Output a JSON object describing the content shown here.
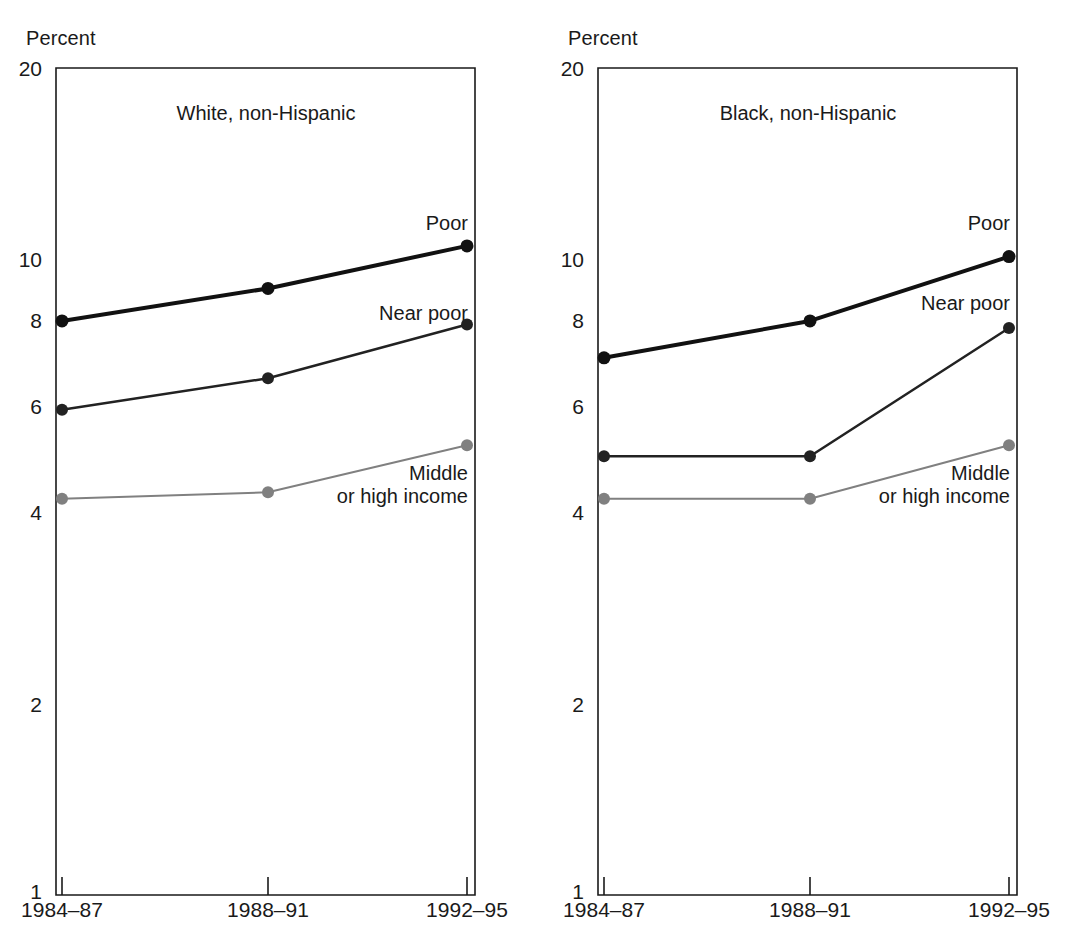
{
  "figure": {
    "axis_unit_label": "Percent",
    "background_color": "#ffffff",
    "ink_color": "#1a1a1a"
  },
  "panels": [
    {
      "id": "white-non-hispanic",
      "title": "White, non-Hispanic",
      "axis_unit_label": "Percent",
      "series_labels": {
        "poor": "Poor",
        "near_poor": "Near poor",
        "middle_line1": "Middle",
        "middle_line2": "or high income"
      }
    },
    {
      "id": "black-non-hispanic",
      "title": "Black, non-Hispanic",
      "axis_unit_label": "Percent",
      "series_labels": {
        "poor": "Poor",
        "near_poor": "Near poor",
        "middle_line1": "Middle",
        "middle_line2": "or high income"
      }
    }
  ],
  "chart_data": [
    {
      "type": "line",
      "title": "White, non-Hispanic",
      "xlabel": "",
      "ylabel": "Percent",
      "yscale": "log",
      "ylim": [
        1,
        20
      ],
      "yticks": [
        1,
        2,
        4,
        6,
        8,
        10,
        20
      ],
      "ytick_labels": [
        "1",
        "2",
        "4",
        "6",
        "8",
        "10",
        "20"
      ],
      "grid": false,
      "legend_position": "inline-right-of-series",
      "categories": [
        "1984–87",
        "1988–91",
        "1992–95"
      ],
      "series": [
        {
          "name": "Poor",
          "values": [
            8.0,
            9.0,
            10.5
          ],
          "color": "#111111",
          "marker_size": 13,
          "line_width": 4
        },
        {
          "name": "Near poor",
          "values": [
            5.8,
            6.5,
            7.9
          ],
          "color": "#222222",
          "marker_size": 12,
          "line_width": 2.5
        },
        {
          "name": "Middle or high income",
          "values": [
            4.2,
            4.3,
            5.1
          ],
          "color": "#808080",
          "marker_size": 12,
          "line_width": 2
        }
      ]
    },
    {
      "type": "line",
      "title": "Black, non-Hispanic",
      "xlabel": "",
      "ylabel": "Percent",
      "yscale": "log",
      "ylim": [
        1,
        20
      ],
      "yticks": [
        1,
        2,
        4,
        6,
        8,
        10,
        20
      ],
      "ytick_labels": [
        "1",
        "2",
        "4",
        "6",
        "8",
        "10",
        "20"
      ],
      "grid": false,
      "legend_position": "inline-right-of-series",
      "categories": [
        "1984–87",
        "1988–91",
        "1992–95"
      ],
      "series": [
        {
          "name": "Poor",
          "values": [
            7.0,
            8.0,
            10.1
          ],
          "color": "#111111",
          "marker_size": 13,
          "line_width": 4
        },
        {
          "name": "Near poor",
          "values": [
            4.9,
            4.9,
            7.8
          ],
          "color": "#222222",
          "marker_size": 12,
          "line_width": 2.5
        },
        {
          "name": "Middle or high income",
          "values": [
            4.2,
            4.2,
            5.1
          ],
          "color": "#808080",
          "marker_size": 12,
          "line_width": 2
        }
      ]
    }
  ]
}
